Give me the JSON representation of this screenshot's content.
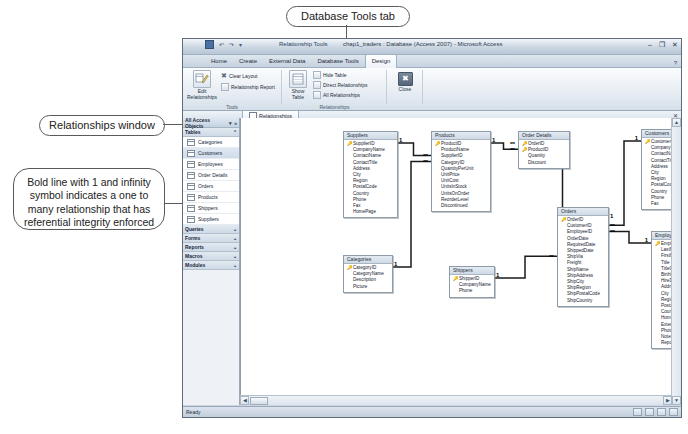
{
  "annotations": [
    {
      "id": "db-tools-tab",
      "text": "Database Tools tab"
    },
    {
      "id": "relationships-window",
      "text": "Relationships window"
    },
    {
      "id": "bold-line",
      "text": "Bold line with 1 and infinity symbol indicates a one to many relationship that has referential integrity enforced"
    }
  ],
  "window": {
    "title": "chap1_traders : Database (Access 2007) - Microsoft Access",
    "contextual_tab_title": "Relationship Tools",
    "minimize": "–",
    "restore": "❐",
    "close": "✕",
    "quick_access": [
      "save-icon",
      "undo-icon",
      "redo-icon",
      "customize-qat-icon"
    ],
    "office_button": "office-orb"
  },
  "ribbon": {
    "tabs": [
      {
        "label": "Home",
        "selected": false
      },
      {
        "label": "Create",
        "selected": false
      },
      {
        "label": "External Data",
        "selected": false
      },
      {
        "label": "Database Tools",
        "selected": false
      },
      {
        "label": "Design",
        "selected": true
      }
    ],
    "help": "?",
    "groups": [
      {
        "name": "Tools",
        "label": "Tools",
        "big_buttons": [
          {
            "label": "Edit\nRelationships",
            "icon": "edit-relationships-icon"
          }
        ],
        "small_buttons": [
          {
            "label": "Clear Layout",
            "icon": "clear-layout-icon"
          },
          {
            "label": "Relationship Report",
            "icon": "relationship-report-icon"
          }
        ]
      },
      {
        "name": "Relationships",
        "label": "Relationships",
        "big_buttons": [
          {
            "label": "Show\nTable",
            "icon": "show-table-icon"
          }
        ],
        "small_buttons": [
          {
            "label": "Hide Table",
            "icon": "hide-table-icon"
          },
          {
            "label": "Direct Relationships",
            "icon": "direct-relationships-icon"
          },
          {
            "label": "All Relationships",
            "icon": "all-relationships-icon"
          }
        ]
      },
      {
        "name": "Close",
        "label": "",
        "big_buttons": [
          {
            "label": "Close",
            "icon": "close-x-icon"
          }
        ],
        "small_buttons": []
      }
    ]
  },
  "document_tab": {
    "label": "Relationships",
    "icon": "relationships-icon",
    "close": "✕"
  },
  "nav_pane": {
    "header": "All Access Objects",
    "header_icons": [
      "chevron-down-icon",
      "shutter-bar-icon"
    ],
    "groups": [
      {
        "label": "Tables",
        "collapse": "⌃",
        "items": [
          {
            "label": "Categories",
            "selected": false
          },
          {
            "label": "Customers",
            "selected": true
          },
          {
            "label": "Employees",
            "selected": false
          },
          {
            "label": "Order Details",
            "selected": false
          },
          {
            "label": "Orders",
            "selected": false
          },
          {
            "label": "Products",
            "selected": false
          },
          {
            "label": "Shippers",
            "selected": false
          },
          {
            "label": "Suppliers",
            "selected": false
          }
        ]
      },
      {
        "label": "Queries",
        "collapse": "⌄",
        "items": []
      },
      {
        "label": "Forms",
        "collapse": "⌄",
        "items": []
      },
      {
        "label": "Reports",
        "collapse": "⌄",
        "items": []
      },
      {
        "label": "Macros",
        "collapse": "⌄",
        "items": []
      },
      {
        "label": "Modules",
        "collapse": "⌄",
        "items": []
      }
    ]
  },
  "tables": [
    {
      "name": "Suppliers",
      "x": 102,
      "y": 13,
      "w": 53,
      "fields": [
        "SupplierID",
        "CompanyName",
        "ContactName",
        "ContactTitle",
        "Address",
        "City",
        "Region",
        "PostalCode",
        "Country",
        "Phone",
        "Fax",
        "HomePage"
      ],
      "pk": 1
    },
    {
      "name": "Products",
      "x": 190,
      "y": 13,
      "w": 58,
      "fields": [
        "ProductID",
        "ProductName",
        "SupplierID",
        "CategoryID",
        "QuantityPerUnit",
        "UnitPrice",
        "UnitCost",
        "UnitsInStock",
        "UnitsOnOrder",
        "ReorderLevel",
        "Discontinued"
      ],
      "pk": 1
    },
    {
      "name": "Order Details",
      "x": 277,
      "y": 13,
      "w": 50,
      "fields": [
        "OrderID",
        "ProductID",
        "Quantity",
        "Discount"
      ],
      "pk": 2
    },
    {
      "name": "Customers",
      "x": 400,
      "y": 11,
      "w": 52,
      "fields": [
        "CustomerID",
        "CompanyName",
        "ContactName",
        "ContactTitle",
        "Address",
        "City",
        "Region",
        "PostalCode",
        "Country",
        "Phone",
        "Fax"
      ],
      "pk": 1
    },
    {
      "name": "Orders",
      "x": 316,
      "y": 89,
      "w": 50,
      "fields": [
        "OrderID",
        "CustomerID",
        "EmployeeID",
        "OrderDate",
        "RequiredDate",
        "ShippedDate",
        "ShipVia",
        "Freight",
        "ShipName",
        "ShipAddress",
        "ShipCity",
        "ShipRegion",
        "ShipPostalCode",
        "ShipCountry"
      ],
      "pk": 1
    },
    {
      "name": "Employees",
      "x": 410,
      "y": 113,
      "w": 52,
      "fields": [
        "EmployeeID",
        "LastName",
        "FirstName",
        "Title",
        "TitleOfCourtesy",
        "BirthDate",
        "HireDate",
        "Address",
        "City",
        "Region",
        "PostalCode",
        "Country",
        "HomePhone",
        "Extension",
        "Photo",
        "Notes",
        "ReportsTo"
      ],
      "pk": 1
    },
    {
      "name": "Categories",
      "x": 102,
      "y": 137,
      "w": 48,
      "fields": [
        "CategoryID",
        "CategoryName",
        "Description",
        "Picture"
      ],
      "pk": 1
    },
    {
      "name": "Shippers",
      "x": 208,
      "y": 148,
      "w": 44,
      "fields": [
        "ShipperID",
        "CompanyName",
        "Phone"
      ],
      "pk": 1
    }
  ],
  "relationship_markers": {
    "one": "1",
    "many": "∞"
  },
  "status_bar": {
    "text": "Ready",
    "view_buttons": [
      "design-view-icon",
      "datasheet-view-icon",
      "layout-view-icon",
      "form-view-icon"
    ]
  }
}
